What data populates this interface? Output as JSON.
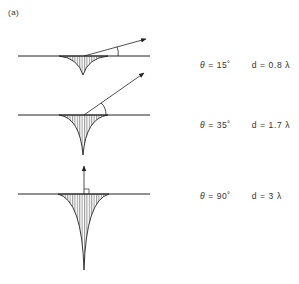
{
  "figure": {
    "panel_label": "(a)",
    "colors": {
      "line": "#222222",
      "hatch": "#555555"
    },
    "rows": [
      {
        "theta_symbol": "θ",
        "theta_text": "= 15˚",
        "d_text": "d = 0.8 λ",
        "angle_deg": 15,
        "depth": 0.8
      },
      {
        "theta_symbol": "θ",
        "theta_text": "= 35˚",
        "d_text": "d = 1.7 λ",
        "angle_deg": 35,
        "depth": 1.7
      },
      {
        "theta_symbol": "θ",
        "theta_text": "= 90˚",
        "d_text": "d = 3 λ",
        "angle_deg": 90,
        "depth": 3
      }
    ]
  }
}
